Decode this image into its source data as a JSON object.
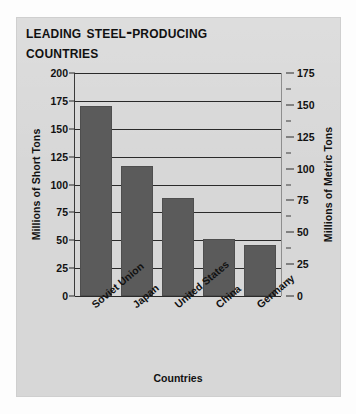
{
  "chart_data": {
    "type": "bar",
    "title": "Leading Steel-Producing\nCountries",
    "categories": [
      "Soviet Union",
      "Japan",
      "United States",
      "China",
      "Germany"
    ],
    "values": [
      170,
      117,
      88,
      51,
      46
    ],
    "xlabel": "Countries",
    "ylabel": "Millions of Short Tons",
    "ylabel_right": "Millions of Metric Tons",
    "ylim": [
      0,
      200
    ],
    "ylim_right": [
      0,
      175
    ],
    "yticks": [
      0,
      25,
      50,
      75,
      100,
      125,
      150,
      175,
      200
    ],
    "yticks_right": [
      0,
      25,
      50,
      75,
      100,
      125,
      150,
      175
    ],
    "yticks_right_minor": [
      12.5,
      37.5,
      62.5,
      87.5,
      112.5,
      137.5,
      162.5,
      187.5
    ],
    "grid": true,
    "legend": "none",
    "bar_color": "#5b5b5b",
    "panel_color": "#d7d7d7",
    "text_color": "#111111",
    "tick_labels_left": [
      "200",
      "175",
      "150",
      "125",
      "100",
      "75",
      "50",
      "25",
      "0"
    ],
    "tick_labels_right": [
      "175",
      "150",
      "125",
      "100",
      "75",
      "50",
      "25",
      "0"
    ]
  }
}
